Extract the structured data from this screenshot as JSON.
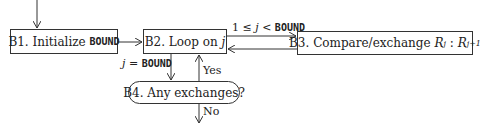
{
  "diagram": {
    "type": "flowchart",
    "nodes": [
      {
        "id": "B1",
        "prefix": "B1. Initialize ",
        "mono": "BOUND"
      },
      {
        "id": "B2",
        "prefix": "B2. Loop on ",
        "var": "j"
      },
      {
        "id": "B3",
        "prefix": "B3. Compare/exchange ",
        "r1": "R",
        "s1": "j",
        "sep": " : ",
        "r2": "R",
        "s2": "j+1"
      },
      {
        "id": "B4",
        "text": "B4. Any exchanges?"
      }
    ],
    "edges": [
      {
        "from": "start",
        "to": "B1"
      },
      {
        "from": "B1",
        "to": "B2"
      },
      {
        "from": "B2",
        "to": "B3",
        "label_pre": "1 ≤ ",
        "label_var": "j",
        "label_mid": " < ",
        "label_mono": "BOUND"
      },
      {
        "from": "B3",
        "to": "B2"
      },
      {
        "from": "B2",
        "to": "B4",
        "label_var": "j",
        "label_mid": " = ",
        "label_mono": "BOUND"
      },
      {
        "from": "B4",
        "to": "B2",
        "label": "Yes"
      },
      {
        "from": "B4",
        "to": "end",
        "label": "No"
      }
    ]
  }
}
